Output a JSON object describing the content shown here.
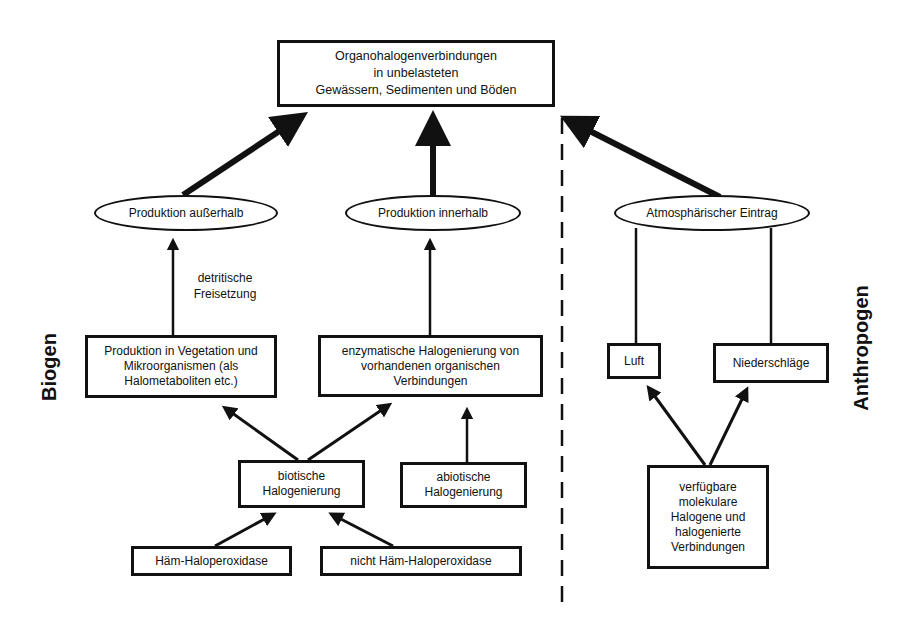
{
  "diagram": {
    "top_node": {
      "text": "Organohalogenverbindungen\nin unbelasteten\nGewässern, Sedimenten und Böden"
    },
    "ellipses": {
      "outside": "Produktion außerhalb",
      "inside": "Produktion innerhalb",
      "atmospheric": "Atmosphärischer Eintrag"
    },
    "edge_labels": {
      "detrital": "detritische\nFreisetzung"
    },
    "boxes": {
      "vegetation": "Produktion in Vegetation und\nMikroorganismen (als\nHalometaboliten etc.)",
      "enzymatic": "enzymatische Halogenierung von\nvorhandenen organischen\nVerbindungen",
      "air": "Luft",
      "precipitation": "Niederschläge",
      "biotic": "biotische\nHalogenierung",
      "abiotic": "abiotische\nHalogenierung",
      "heme": "Häm-Haloperoxidase",
      "non_heme": "nicht Häm-Haloperoxidase",
      "available": "verfügbare\nmolekulare\nHalogene und\nhalogenierte\nVerbindungen"
    },
    "side_labels": {
      "left": "Biogen",
      "right": "Anthropogen"
    },
    "colors": {
      "stroke": "#111111",
      "background": "#ffffff"
    }
  }
}
